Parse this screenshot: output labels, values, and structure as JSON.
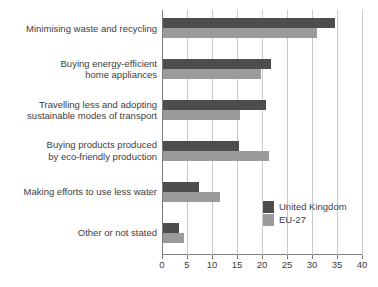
{
  "chart_data": {
    "type": "bar",
    "orientation": "horizontal",
    "title": "",
    "subtitle": "",
    "xlabel": "",
    "ylabel": "",
    "xlim": [
      0,
      40
    ],
    "xticks": [
      0,
      5,
      10,
      15,
      20,
      25,
      30,
      35,
      40
    ],
    "xtick_labels": [
      "0",
      "5",
      "10",
      "15",
      "20",
      "25",
      "30",
      "35",
      "40"
    ],
    "grid": true,
    "grid_axis": "x",
    "legend_position": "inside-right-lower",
    "categories": [
      "Minimising waste and recycling",
      "Buying energy-efficient\nhome appliances",
      "Travelling less and adopting\nsustainable modes of transport",
      "Buying products produced\nby eco-friendly production",
      "Making efforts to use less water",
      "Other or not stated"
    ],
    "series": [
      {
        "name": "United Kingdom",
        "color": "#4d4d4d",
        "values": [
          34.3,
          21.6,
          20.6,
          15.2,
          7.2,
          3.2
        ]
      },
      {
        "name": "EU-27",
        "color": "#9b9b9b",
        "values": [
          30.8,
          19.6,
          15.4,
          21.2,
          11.4,
          4.2
        ]
      }
    ]
  },
  "legend": {
    "items": [
      {
        "label": "United Kingdom",
        "color": "#4d4d4d"
      },
      {
        "label": "EU-27",
        "color": "#9b9b9b"
      }
    ]
  },
  "colors": {
    "axis": "#7d7d7d",
    "grid": "#c9c9c9",
    "text": "#3d3d3d",
    "background": "#ffffff"
  }
}
